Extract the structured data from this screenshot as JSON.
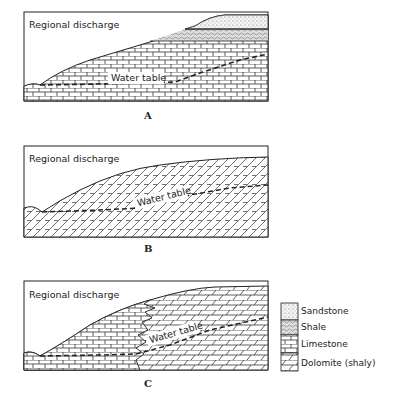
{
  "figure": {
    "panels": [
      {
        "id": "A",
        "label": "A",
        "discharge_label": "Regional discharge",
        "water_table_label": "Water table"
      },
      {
        "id": "B",
        "label": "B",
        "discharge_label": "Regional discharge",
        "water_table_label": "Water table"
      },
      {
        "id": "C",
        "label": "C",
        "discharge_label": "Regional discharge",
        "water_table_label": "Water table"
      }
    ],
    "legend": {
      "items": [
        {
          "key": "sandstone",
          "label": "Sandstone"
        },
        {
          "key": "shale",
          "label": "Shale"
        },
        {
          "key": "limestone",
          "label": "Limestone"
        },
        {
          "key": "dolomite",
          "label": "Dolomite (shaly)"
        }
      ]
    }
  }
}
